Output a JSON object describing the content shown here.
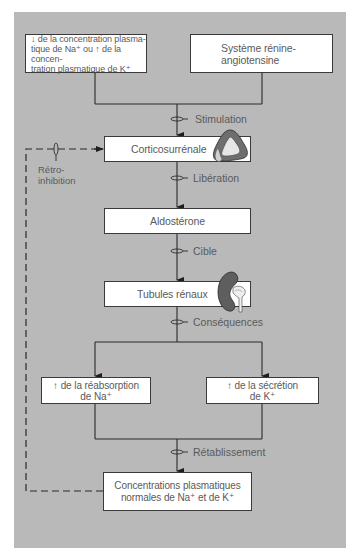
{
  "diagram": {
    "colors": {
      "panel": "#b9b9b9",
      "box_fill": "#ffffff",
      "box_border": "#3a3a3a",
      "line": "#2a2a2a",
      "text": "#5a5a5a",
      "adrenal_gland": "#6e6e6e",
      "kidney": "#5e5e5e"
    },
    "nodes": {
      "stimulus_ion": {
        "line1": "↓ de la concentration plasma-",
        "line2": "tique de Na⁺ ou ↑ de la concen-",
        "line3": "tration plasmatique de K⁺"
      },
      "renin_angiotensin": {
        "line1": "Système rénine-",
        "line2": "angiotensine"
      },
      "adrenal_cortex": {
        "label": "Corticosurrénale"
      },
      "aldosterone": {
        "label": "Aldostérone"
      },
      "renal_tubules": {
        "label": "Tubules rénaux"
      },
      "na_reabsorption": {
        "line1": "↑ de la réabsorption",
        "line2": "de Na⁺"
      },
      "k_secretion": {
        "line1": "↑ de la sécrétion",
        "line2": "de K⁺"
      },
      "normal_concentrations": {
        "line1": "Concentrations plasmatiques",
        "line2": "normales de Na⁺ et de K⁺"
      }
    },
    "edge_labels": {
      "stimulation": "Stimulation",
      "liberation": "Libération",
      "cible": "Cible",
      "consequences": "Conséquences",
      "retablissement": "Rétablissement",
      "feedback_line1": "Rétro-",
      "feedback_line2": "inhibition"
    },
    "icons": {
      "adrenal": "adrenal-gland-icon",
      "kidney": "kidney-icon"
    }
  }
}
